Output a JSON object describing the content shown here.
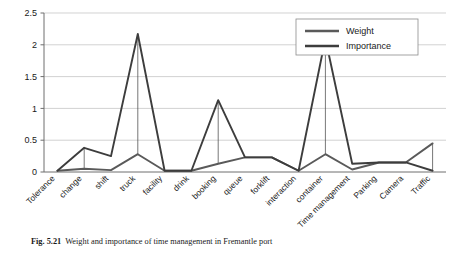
{
  "figure": {
    "caption_number": "Fig. 5.21",
    "caption_text": "Weight and importance of time management in Fremantle port"
  },
  "chart_data": {
    "type": "line",
    "title": "",
    "xlabel": "",
    "ylabel": "",
    "ylim": [
      0,
      2.5
    ],
    "ytick_labels": [
      "0",
      "0.5",
      "1",
      "1.5",
      "2",
      "2.5"
    ],
    "ytick_values": [
      0,
      0.5,
      1,
      1.5,
      2,
      2.5
    ],
    "grid": true,
    "legend_position": "top-right",
    "categories": [
      "Tolerance",
      "change",
      "shift",
      "truck",
      "facility",
      "drink",
      "booking",
      "queue",
      "forklift",
      "interaction",
      "container",
      "Time management",
      "Parking",
      "Camera",
      "Traffic"
    ],
    "series": [
      {
        "name": "Weight",
        "color": "#5a5a5a",
        "values": [
          0.02,
          0.05,
          0.03,
          0.28,
          0.02,
          0.02,
          0.13,
          0.23,
          0.23,
          0.02,
          0.28,
          0.04,
          0.15,
          0.15,
          0.45
        ]
      },
      {
        "name": "Importance",
        "color": "#3d3d3d",
        "values": [
          0.02,
          0.38,
          0.25,
          2.17,
          0.02,
          0.02,
          1.13,
          0.23,
          0.23,
          0.02,
          2.1,
          0.13,
          0.15,
          0.15,
          0.02
        ]
      }
    ]
  }
}
